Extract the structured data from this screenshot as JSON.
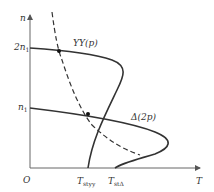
{
  "axes": {
    "y_label": "n",
    "x_label": "T",
    "origin_label": "O"
  },
  "y_ticks": [
    {
      "label": "2n",
      "sub": "1"
    },
    {
      "label": "n",
      "sub": "1"
    }
  ],
  "curves": {
    "yy": {
      "label": "YY(p)"
    },
    "delta": {
      "label": "Δ(2p)"
    },
    "load": {
      "style": "dashed"
    }
  },
  "x_ticks": [
    {
      "label": "T",
      "sub": "styy"
    },
    {
      "label": "T",
      "sub": "stΔ"
    }
  ],
  "colors": {
    "curve": "#333333",
    "axis": "#555555"
  }
}
